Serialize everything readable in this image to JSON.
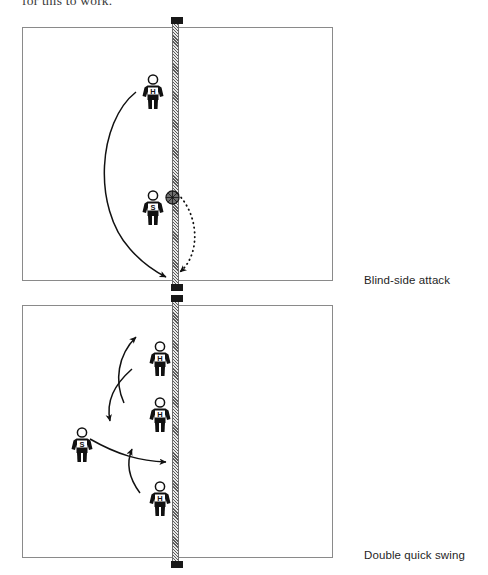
{
  "page": {
    "running_text": "for this to work.",
    "background_color": "#ffffff",
    "ink_color": "#1a1a1a",
    "net_color": "#5a5a5a",
    "player_color": "#111111"
  },
  "figures": [
    {
      "id": "figure-1",
      "caption": "Blind-side attack",
      "court": {
        "net_label": "net",
        "net_side": "center"
      },
      "players": [
        {
          "id": "f1-hitter",
          "role_label": "H",
          "role_name": "hitter",
          "x": 139,
          "y": 47
        },
        {
          "id": "f1-setter",
          "role_label": "S",
          "role_name": "setter",
          "x": 139,
          "y": 163
        }
      ],
      "balls": [
        {
          "id": "f1-ball",
          "name": "volleyball",
          "x": 165,
          "y": 163
        }
      ],
      "arrows": [
        {
          "id": "f1-run-path",
          "style": "solid",
          "meaning": "player movement"
        },
        {
          "id": "f1-ball-path",
          "style": "dotted",
          "meaning": "ball flight"
        }
      ]
    },
    {
      "id": "figure-2",
      "caption": "Double quick swing",
      "court": {
        "net_label": "net",
        "net_side": "center"
      },
      "players": [
        {
          "id": "f2-hitter-front",
          "role_label": "H",
          "role_name": "hitter",
          "x": 146,
          "y": 36
        },
        {
          "id": "f2-hitter-back",
          "role_label": "H",
          "role_name": "hitter",
          "x": 146,
          "y": 92
        },
        {
          "id": "f2-setter",
          "role_label": "S",
          "role_name": "setter",
          "x": 68,
          "y": 122
        },
        {
          "id": "f2-hitter-low",
          "role_label": "H",
          "role_name": "hitter",
          "x": 146,
          "y": 176
        }
      ],
      "balls": [],
      "arrows": [
        {
          "id": "f2-swing-up",
          "style": "solid",
          "meaning": "player movement"
        },
        {
          "id": "f2-swing-down",
          "style": "solid",
          "meaning": "player movement"
        },
        {
          "id": "f2-set-path",
          "style": "solid",
          "meaning": "set direction"
        },
        {
          "id": "f2-approach",
          "style": "solid",
          "meaning": "approach"
        }
      ]
    }
  ]
}
